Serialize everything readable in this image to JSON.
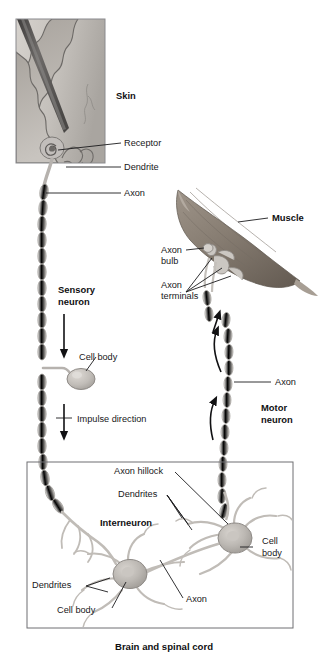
{
  "figure": {
    "background_color": "#ffffff",
    "caption": "Brain and spinal cord"
  },
  "palette": {
    "label_text": "#18181a",
    "leader_line": "#1b1b1d",
    "box_border": "#6f6f72",
    "skin_panel_border": "#8a8a8d",
    "skin_epidermis": "#b9b5b0",
    "skin_dermis": "#cdc9c4",
    "needle_dark": "#5f5d5c",
    "muscle_fill": "#8d8378",
    "muscle_shade": "#6e655c",
    "neuron_fill": "#bdb9b4",
    "myelin_fill": "#e3e1de",
    "myelin_stroke": "#a8a5a1"
  },
  "skin_panel": {
    "name": "skin-inset-panel",
    "label": "Skin",
    "has_needle": true,
    "has_receptor_coil": true
  },
  "labels": [
    {
      "id": "skin",
      "text": "Skin",
      "bold": true,
      "x": 116,
      "y": 99
    },
    {
      "id": "receptor",
      "text": "Receptor",
      "bold": false,
      "x": 124,
      "y": 146
    },
    {
      "id": "dendrite",
      "text": "Dendrite",
      "bold": false,
      "x": 124,
      "y": 170
    },
    {
      "id": "axon-top",
      "text": "Axon",
      "bold": false,
      "x": 124,
      "y": 196
    },
    {
      "id": "muscle",
      "text": "Muscle",
      "bold": true,
      "x": 272,
      "y": 221
    },
    {
      "id": "axon-bulb-1",
      "text": "Axon",
      "bold": false,
      "x": 161,
      "y": 253
    },
    {
      "id": "axon-bulb-2",
      "text": "bulb",
      "bold": false,
      "x": 161,
      "y": 264
    },
    {
      "id": "axon-terminals-1",
      "text": "Axon",
      "bold": false,
      "x": 161,
      "y": 288
    },
    {
      "id": "axon-terminals-2",
      "text": "terminals",
      "bold": false,
      "x": 161,
      "y": 299
    },
    {
      "id": "sensory-1",
      "text": "Sensory",
      "bold": true,
      "x": 58,
      "y": 293
    },
    {
      "id": "sensory-2",
      "text": "neuron",
      "bold": true,
      "x": 58,
      "y": 305
    },
    {
      "id": "cell-body-top",
      "text": "Cell body",
      "bold": false,
      "x": 79,
      "y": 360
    },
    {
      "id": "impulse",
      "text": "Impulse direction",
      "bold": false,
      "x": 77,
      "y": 420
    },
    {
      "id": "axon-right",
      "text": "Axon",
      "bold": false,
      "x": 275,
      "y": 385
    },
    {
      "id": "motor-1",
      "text": "Motor",
      "bold": true,
      "x": 261,
      "y": 411
    },
    {
      "id": "motor-2",
      "text": "neuron",
      "bold": true,
      "x": 261,
      "y": 423
    },
    {
      "id": "axon-hillock",
      "text": "Axon hillock",
      "bold": false,
      "x": 114,
      "y": 474
    },
    {
      "id": "dendrites-top",
      "text": "Dendrites",
      "bold": false,
      "x": 126,
      "y": 497
    },
    {
      "id": "interneuron",
      "text": "Interneuron",
      "bold": true,
      "x": 107,
      "y": 526
    },
    {
      "id": "cell-body-r-1",
      "text": "Cell",
      "bold": false,
      "x": 262,
      "y": 544
    },
    {
      "id": "cell-body-r-2",
      "text": "body",
      "bold": false,
      "x": 262,
      "y": 556
    },
    {
      "id": "dendrites-bot",
      "text": "Dendrites",
      "bold": false,
      "x": 39,
      "y": 588
    },
    {
      "id": "axon-bottom",
      "text": "Axon",
      "bold": false,
      "x": 185,
      "y": 602
    },
    {
      "id": "cell-body-bot",
      "text": "Cell body",
      "bold": false,
      "x": 64,
      "y": 613
    }
  ],
  "arrows": [
    {
      "id": "impulse-arrow-upper",
      "direction": "down",
      "x": 64,
      "from_y": 314,
      "to_y": 358
    },
    {
      "id": "impulse-arrow-lower",
      "direction": "down",
      "x": 64,
      "from_y": 404,
      "to_y": 440
    },
    {
      "id": "motor-arrow-lower",
      "direction": "up",
      "x": 213,
      "from_y": 440,
      "to_y": 396
    },
    {
      "id": "motor-arrow-upper",
      "direction": "up",
      "x": 219,
      "from_y": 372,
      "to_y": 328
    },
    {
      "id": "terminal-arrow",
      "direction": "up",
      "x": 218,
      "from_y": 330,
      "to_y": 312
    }
  ],
  "spinal_box": {
    "name": "brain-spinal-cord-box",
    "x": 27,
    "y": 462,
    "width": 266,
    "height": 166
  },
  "neurons": {
    "sensory": {
      "name": "sensory-neuron",
      "cell_body_shape": "oval-ganglion"
    },
    "motor": {
      "name": "motor-neuron",
      "cell_body_shape": "multipolar"
    },
    "interneuron": {
      "name": "interneuron",
      "cell_body_shape": "multipolar"
    }
  }
}
